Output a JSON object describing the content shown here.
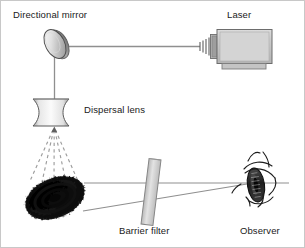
{
  "figure": {
    "type": "optical-ray-diagram",
    "width": 305,
    "height": 248,
    "background": "#ffffff",
    "border_color": "#c8c8c8"
  },
  "labels": {
    "directional_mirror": "Directional mirror",
    "laser": "Laser",
    "dispersal_lens": "Dispersal lens",
    "barrier_filter": "Barrier filter",
    "observer": "Observer"
  },
  "components": {
    "mirror": {
      "name": "directional-mirror",
      "shape": "ellipse",
      "cx": 54,
      "cy": 43,
      "rx": 9,
      "ry": 15,
      "rotation_deg": -28,
      "fill_light": "#f2f2f2",
      "fill_dark": "#8c8c8c",
      "stroke": "#4d4d4d"
    },
    "laser": {
      "name": "laser-source",
      "body_x": 214,
      "body_y": 29,
      "body_w": 56,
      "body_h": 33,
      "fill": "#c9c9c9",
      "stroke": "#6e6e6e",
      "nozzle_bars": 4,
      "has_base": true
    },
    "dispersal_lens": {
      "name": "dispersal-lens",
      "cx": 50,
      "cy": 111,
      "width": 36,
      "height": 27,
      "kind": "biconcave",
      "fill_light": "#ececec",
      "fill_dark": "#9a9a9a",
      "stroke": "#5a5a5a"
    },
    "fingerprint": {
      "name": "fingerprint-evidence",
      "cx": 54,
      "cy": 197,
      "rx": 30,
      "ry": 19,
      "rotation_deg": -22,
      "fill": "#111111"
    },
    "barrier_filter": {
      "name": "barrier-filter",
      "cx": 150,
      "cy": 191,
      "width": 11,
      "height": 66,
      "rotation_deg": 7,
      "fill": "#cfcfcf",
      "stroke": "#808080"
    },
    "observer_eye": {
      "name": "observer-eye",
      "cx": 256,
      "cy": 184,
      "iris_fill": "#2a2a2a",
      "stroke": "#1a1a1a"
    }
  },
  "rays": {
    "laser_to_mirror": {
      "name": "beam-laser-to-mirror",
      "style": "solid",
      "color": "#8a8a8a",
      "from": [
        200,
        46
      ],
      "to": [
        60,
        46
      ]
    },
    "mirror_to_lens": {
      "name": "beam-mirror-to-lens",
      "style": "solid",
      "color": "#8a8a8a",
      "from": [
        54,
        52
      ],
      "to": [
        54,
        100
      ]
    },
    "dispersed_beams": {
      "name": "dispersed-light-rays",
      "style": "dashed",
      "color": "#9a9a9a",
      "count": 5,
      "origin": [
        53,
        128
      ],
      "spread_to_y": 178
    },
    "scatter_to_observer": {
      "name": "reflected-light-to-observer",
      "style": "solid",
      "color": "#8a8a8a",
      "upper": [
        [
          84,
          182
        ],
        [
          283,
          182
        ]
      ],
      "lower": [
        [
          84,
          209
        ],
        [
          252,
          182
        ]
      ]
    }
  },
  "colors": {
    "line": "#8a8a8a",
    "ink": "#1a1a1a",
    "metal_light": "#e8e8e8",
    "metal_mid": "#c2c2c2",
    "metal_dark": "#8a8a8a"
  }
}
